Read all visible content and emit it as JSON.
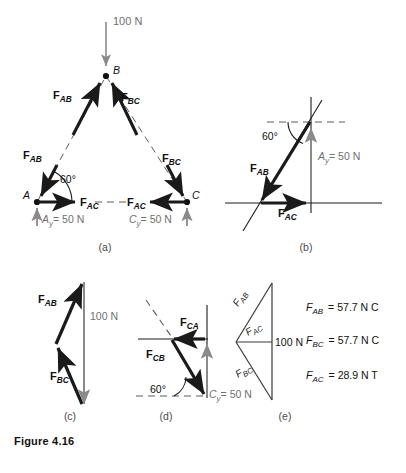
{
  "figure": {
    "caption": "Figure 4.16",
    "load_label": "100 N",
    "angle_label": "60°"
  },
  "colors": {
    "ink": "#1a1a1a",
    "gray": "#8a8a8a",
    "thin": "#3a3a3a",
    "background": "#ffffff"
  },
  "panels": [
    {
      "id": "a",
      "label": "(a)",
      "joints": [
        "A",
        "B",
        "C"
      ],
      "forces": [
        "F",
        "F",
        "F",
        "F",
        "F",
        "F"
      ],
      "reaction_left": "= 50 N",
      "reaction_right": "= 50 N",
      "load": "100 N",
      "angle": "60°"
    },
    {
      "id": "b",
      "label": "(b)",
      "angle": "60°",
      "reaction": "= 50 N"
    },
    {
      "id": "c",
      "label": "(c)",
      "load": "100 N"
    },
    {
      "id": "d",
      "label": "(d)",
      "angle": "60°",
      "reaction": "= 50 N"
    },
    {
      "id": "e",
      "label": "(e)",
      "load": "100 N"
    }
  ],
  "force_symbols": {
    "F": "F",
    "AB": "AB",
    "BC": "BC",
    "AC": "AC",
    "CA": "CA",
    "CB": "CB",
    "Ay_main": "A",
    "Ay_sub": "y",
    "Cy_main": "C",
    "Cy_sub": "y"
  },
  "results": [
    {
      "symbol": "F",
      "sub": "AB",
      "eq": "=",
      "value": "57.7 N C"
    },
    {
      "symbol": "F",
      "sub": "BC",
      "eq": "=",
      "value": "57.7 N C"
    },
    {
      "symbol": "F",
      "sub": "AC",
      "eq": "=",
      "value": "28.9 N T"
    }
  ]
}
